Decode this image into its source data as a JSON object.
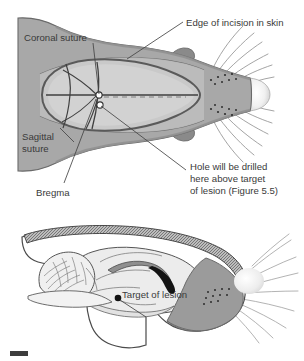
{
  "figure": {
    "name": "rat-stereotaxic-surgery-diagram",
    "panels": [
      {
        "id": "dorsal-view",
        "name": "Dorsal view of rat head with skull sutures exposed"
      },
      {
        "id": "sagittal-view",
        "name": "Sagittal section of rat head showing brain and lesion target"
      }
    ]
  },
  "labels": {
    "coronal_suture": "Coronal suture",
    "edge_of_incision": "Edge of incision in skin",
    "sagittal_suture_line1": "Sagittal",
    "sagittal_suture_line2": "suture",
    "bregma": "Bregma",
    "hole_line1": "Hole will be drilled",
    "hole_line2": "here above target",
    "hole_line3": "of lesion (Figure 5.5)",
    "target_of_lesion": "Target of lesion"
  },
  "colors": {
    "skin": "#a8a8a8",
    "skin_dark": "#8e8e8e",
    "skull": "#c4c4c4",
    "skull_light": "#cfcfcf",
    "brain": "#e8e8e8",
    "brain_mid": "#dcdcdc",
    "outline": "#4a4a4a",
    "text": "#3a3a3a",
    "nose": "#ececec",
    "target": "#111111",
    "white": "#ffffff",
    "leader": "#555555"
  }
}
